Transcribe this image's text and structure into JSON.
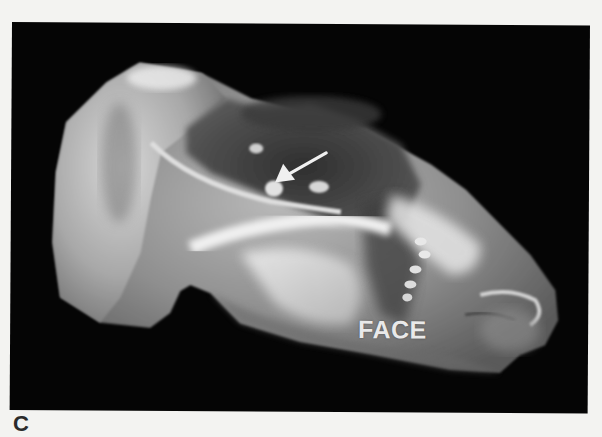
{
  "figure": {
    "panel_label": "C",
    "image_type": "3D ultrasound rendering (grayscale)",
    "annotations": {
      "face_label": "FACE",
      "arrow": {
        "icon": "arrow-icon",
        "direction": "down-left",
        "color": "#f0f0f0"
      }
    },
    "colors": {
      "page_background": "#f3f3f1",
      "frame_background": "#050505",
      "label_color": "#2b2b2b",
      "annotation_color": "#e9e9e9"
    }
  }
}
